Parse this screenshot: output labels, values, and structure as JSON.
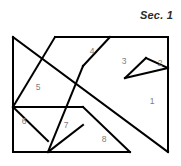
{
  "caption": {
    "text": "Sec. 1"
  },
  "figure": {
    "name": "tangram-square-diagram",
    "stroke_color": "#000000",
    "fill_color": "#ffffff",
    "label_color": "#7d7d7d",
    "outer_square": {
      "left": 13,
      "top": 37,
      "right": 168,
      "bottom": 152
    },
    "pieces": [
      {
        "id": "piece-1",
        "label": "1",
        "label_x": 152,
        "label_y": 102,
        "points": "168,68 168,152 125,110"
      },
      {
        "id": "piece-2",
        "label": "2",
        "label_x": 160,
        "label_y": 64,
        "points": "168,37 168,68 146,58"
      },
      {
        "id": "piece-3",
        "label": "3",
        "label_x": 124,
        "label_y": 62,
        "points": "110,37 168,37 146,58 125,78"
      },
      {
        "id": "piece-4",
        "label": "4",
        "label_x": 92,
        "label_y": 52,
        "points": "55,37 110,37 83,66"
      },
      {
        "id": "piece-5",
        "label": "5",
        "label_x": 38,
        "label_y": 88,
        "points": "13,37 83,107 13,107"
      },
      {
        "id": "piece-6",
        "label": "6",
        "label_x": 24,
        "label_y": 122,
        "points": "13,107 48,141 13,152"
      },
      {
        "id": "piece-7",
        "label": "7",
        "label_x": 66,
        "label_y": 126,
        "points": "13,107 83,107 106,130 48,152"
      },
      {
        "id": "piece-8",
        "label": "8",
        "label_x": 104,
        "label_y": 140,
        "points": "83,125 130,152 48,152"
      }
    ],
    "edges": [
      {
        "name": "left-edge",
        "d": "M 13,37 L 13,152"
      },
      {
        "name": "right-edge",
        "d": "M 168,37 L 168,152"
      },
      {
        "name": "top-edge-right",
        "d": "M 55,37 L 168,37"
      },
      {
        "name": "bottom-edge",
        "d": "M 13,152 L 130,152"
      },
      {
        "name": "main-diagonal",
        "d": "M 13,37 L 168,152"
      },
      {
        "name": "band-diagonal",
        "d": "M 55,37 L 13,107"
      },
      {
        "name": "band-diagonal-2",
        "d": "M 83,66 L 48,152"
      },
      {
        "name": "cut-4",
        "d": "M 110,37 L 83,66"
      },
      {
        "name": "cut-3",
        "d": "M 146,58 L 125,78"
      },
      {
        "name": "cut-2",
        "d": "M 168,68 L 146,58"
      },
      {
        "name": "cut-1",
        "d": "M 168,68 L 125,78"
      },
      {
        "name": "cut-5",
        "d": "M 13,107 L 83,107"
      },
      {
        "name": "cut-6",
        "d": "M 13,107 L 48,141"
      },
      {
        "name": "cut-7",
        "d": "M 83,107 L 130,152"
      },
      {
        "name": "cut-8",
        "d": "M 83,125 L 48,152"
      }
    ]
  }
}
